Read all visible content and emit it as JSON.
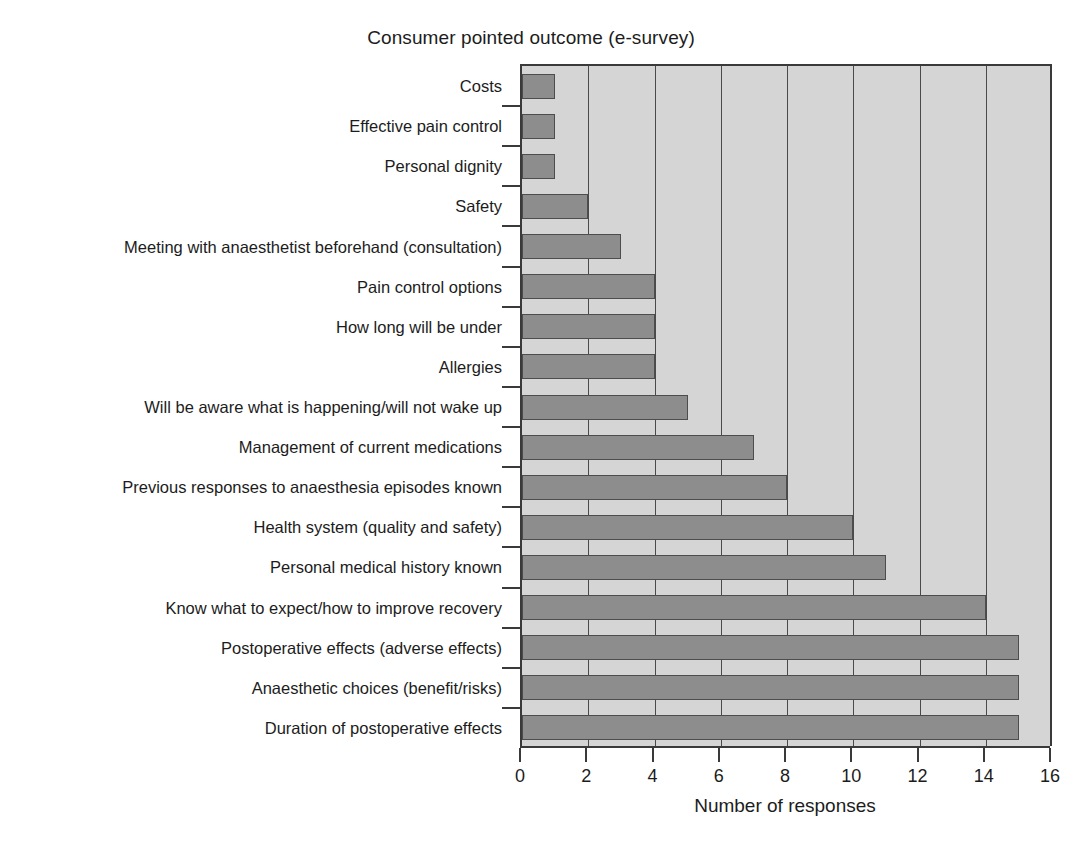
{
  "chart_data": {
    "type": "bar",
    "orientation": "horizontal",
    "title": "Consumer pointed outcome (e-survey)",
    "xlabel": "Number of responses",
    "ylabel": "",
    "xlim": [
      0,
      16
    ],
    "xticks": [
      0,
      2,
      4,
      6,
      8,
      10,
      12,
      14,
      16
    ],
    "grid": "vertical",
    "legend": null,
    "categories": [
      "Costs",
      "Effective pain control",
      "Personal dignity",
      "Safety",
      "Meeting with anaesthetist beforehand (consultation)",
      "Pain control options",
      "How long will be under",
      "Allergies",
      "Will be aware what is happening/will not wake up",
      "Management of current medications",
      "Previous responses to anaesthesia episodes known",
      "Health system (quality and safety)",
      "Personal medical history known",
      "Know what to expect/how to improve recovery",
      "Postoperative effects (adverse effects)",
      "Anaesthetic choices (benefit/risks)",
      "Duration of postoperative effects"
    ],
    "values": [
      1,
      1,
      1,
      2,
      3,
      4,
      4,
      4,
      5,
      7,
      8,
      10,
      11,
      14,
      15,
      15,
      15
    ]
  },
  "style": {
    "bar_fill": "#8d8d8d",
    "bar_edge": "#4d4d4d",
    "plot_background": "#d5d5d5",
    "axis_color": "#3a3a3a",
    "text_color": "#1c1c1c",
    "page_background": "#ffffff"
  }
}
